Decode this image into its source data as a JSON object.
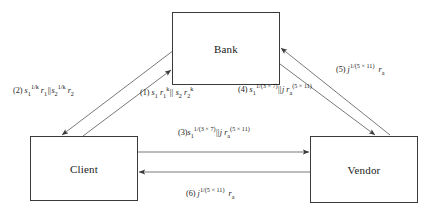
{
  "diagram": {
    "background_color": "#ffffff",
    "line_color": "#5a5a5a",
    "text_color": "#1a1a1a",
    "nodes": [
      {
        "id": "bank",
        "label": "Bank"
      },
      {
        "id": "client",
        "label": "Client"
      },
      {
        "id": "vendor",
        "label": "Vendor"
      }
    ],
    "edges": [
      {
        "id": "edge-1",
        "number": "(1)",
        "from": "client",
        "to": "bank",
        "direction": "client-to-bank",
        "message_plain": "s1 r1^k || s2 r2^k",
        "parts": {
          "s1": "s",
          "s1_sub": "1",
          "r1": "r",
          "r1_sub": "1",
          "r1_sup": "k",
          "sep": "||",
          "s2": "s",
          "s2_sub": "2",
          "r2": "r",
          "r2_sub": "2",
          "r2_sup": "k"
        }
      },
      {
        "id": "edge-2",
        "number": "(2)",
        "from": "bank",
        "to": "client",
        "direction": "bank-to-client",
        "message_plain": "s1^(1/k) r1 || s2^(1/k) r2",
        "parts": {
          "s1": "s",
          "s1_sub": "1",
          "s1_sup": "1/k",
          "r1": "r",
          "r1_sub": "1",
          "sep": "||",
          "s2": "s",
          "s2_sub": "2",
          "s2_sup": "1/k",
          "r2": "r",
          "r2_sub": "2"
        }
      },
      {
        "id": "edge-3",
        "number": "(3)",
        "from": "client",
        "to": "vendor",
        "direction": "client-to-vendor",
        "message_plain": "s1^(1/(3x7)) || j ra^(5x11)",
        "parts": {
          "s1": "s",
          "s1_sub": "1",
          "s1_sup": "1/(3 × 7)",
          "sep": "||",
          "j": "j",
          "ra": "r",
          "ra_sub": "a",
          "ra_sup": "(5 × 11)"
        }
      },
      {
        "id": "edge-4",
        "number": "(4)",
        "from": "vendor",
        "to": "bank",
        "direction": "vendor-to-bank",
        "message_plain": "s1^(1/(3x7)) || j ra^(5x11)",
        "parts": {
          "s1": "s",
          "s1_sub": "1",
          "s1_sup": "1/(3 × 7)",
          "sep": "||",
          "j": "j",
          "ra": "r",
          "ra_sub": "a",
          "ra_sup": "(5 × 11)"
        }
      },
      {
        "id": "edge-5",
        "number": "(5)",
        "from": "bank",
        "to": "vendor",
        "direction": "bank-to-vendor",
        "message_plain": "j^(1/(5x11)) ra",
        "parts": {
          "j": "j",
          "j_sup": "1/(5 × 11)",
          "ra": "r",
          "ra_sub": "a"
        }
      },
      {
        "id": "edge-6",
        "number": "(6)",
        "from": "vendor",
        "to": "client",
        "direction": "vendor-to-client",
        "message_plain": "j^(1/(5x11)) ra",
        "parts": {
          "j": "j",
          "j_sup": "1/(5 × 11)",
          "ra": "r",
          "ra_sub": "a"
        }
      }
    ]
  }
}
